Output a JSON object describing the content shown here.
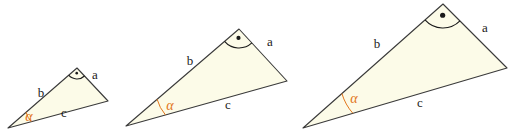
{
  "figure": {
    "background_color": "#ffffff",
    "fill_color": "#FCFBE8",
    "stroke_color": "#3A3A3A",
    "accent_color": "#E2761B",
    "right_angle_color": "#1a1a1a",
    "labels": {
      "side_a": "a",
      "side_b": "b",
      "side_c": "c",
      "angle_alpha": "α"
    },
    "triangles": [
      {
        "name": "small-triangle",
        "index": 1,
        "vertices": {
          "alpha_vertex": [
            8,
            128
          ],
          "apex_vertex": [
            77,
            68
          ],
          "right_vertex": [
            108,
            101
          ]
        },
        "label_positions": {
          "a": [
            95,
            76
          ],
          "b": [
            41,
            94
          ],
          "c": [
            64,
            114
          ],
          "alpha": [
            29,
            118
          ]
        },
        "alpha_arc_radius": 24,
        "right_angle_arc_radius": 11,
        "right_angle_dot_radius": 1.3
      },
      {
        "name": "medium-triangle",
        "index": 2,
        "vertices": {
          "alpha_vertex": [
            126,
            126
          ],
          "apex_vertex": [
            239,
            29
          ],
          "right_vertex": [
            287,
            81
          ]
        },
        "label_positions": {
          "a": [
            270,
            43
          ],
          "b": [
            190,
            62
          ],
          "c": [
            228,
            106
          ],
          "alpha": [
            170,
            107
          ]
        },
        "alpha_arc_radius": 41,
        "right_angle_arc_radius": 19,
        "right_angle_dot_radius": 2.1
      },
      {
        "name": "large-triangle",
        "index": 3,
        "vertices": {
          "alpha_vertex": [
            303,
            128
          ],
          "apex_vertex": [
            443,
            4
          ],
          "right_vertex": [
            507,
            68
          ]
        },
        "label_positions": {
          "a": [
            485,
            29
          ],
          "b": [
            377,
            45
          ],
          "c": [
            420,
            104
          ],
          "alpha": [
            354,
            100
          ]
        },
        "alpha_arc_radius": 52,
        "right_angle_arc_radius": 24,
        "right_angle_dot_radius": 2.6
      }
    ]
  }
}
